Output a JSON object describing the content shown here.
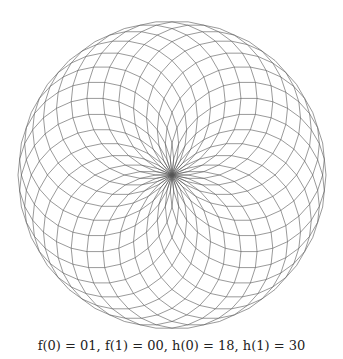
{
  "figure": {
    "center": [
      172,
      175
    ],
    "outer_radius": 154,
    "circle_count": 30,
    "polygon_sides": 30,
    "stroke_color": "#555555",
    "stroke_width": 0.6
  },
  "caption": {
    "text": "f(0) = 01, f(1) = 00, h(0) = 18, h(1) = 30"
  }
}
